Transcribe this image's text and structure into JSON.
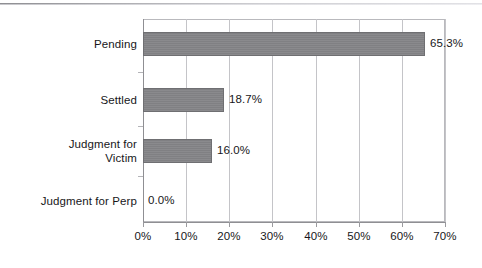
{
  "chart_data": {
    "type": "bar",
    "orientation": "horizontal",
    "title": "",
    "subtitle": "",
    "xlabel": "",
    "ylabel": "",
    "categories": [
      "Pending",
      "Settled",
      "Judgment for Victim",
      "Judgment for Perp"
    ],
    "values": [
      65.3,
      18.7,
      16.0,
      0.0
    ],
    "value_labels": [
      "65.3%",
      "18.7%",
      "16.0%",
      "0.0%"
    ],
    "xlim": [
      0,
      70
    ],
    "xtick_values": [
      0,
      10,
      20,
      30,
      40,
      50,
      60,
      70
    ],
    "xtick_labels": [
      "0%",
      "10%",
      "20%",
      "30%",
      "40%",
      "50%",
      "60%",
      "70%"
    ],
    "grid": true,
    "legend": false,
    "legend_position": "none",
    "bar_color": "#848487",
    "bar_edge_color": "#6f6f72",
    "gridline_color": "#c4c4c8",
    "axis_color": "#8f8f93",
    "text_color": "#17171a",
    "background": "#ffffff",
    "category_label_lines": [
      [
        "Pending"
      ],
      [
        "Settled"
      ],
      [
        "Judgment for",
        "Victim"
      ],
      [
        "Judgment for Perp"
      ]
    ]
  }
}
